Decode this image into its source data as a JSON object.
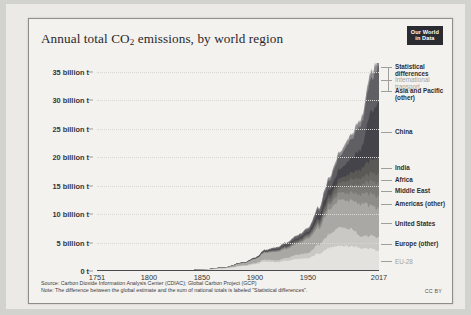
{
  "header": {
    "title_prefix": "Annual total CO",
    "title_sub": "2",
    "title_suffix": " emissions, by world region",
    "logo_line1": "Our World",
    "logo_line2": "in Data"
  },
  "footer": {
    "source": "Source: Carbon Dioxide Information Analysis Center (CDIAC); Global Carbon Project (GCP)",
    "note": "Note: The difference between the global estimate and the sum of national totals is labeled \"Statistical differences\".",
    "license": "CC BY"
  },
  "chart_data": {
    "type": "area",
    "title": "Annual total CO2 emissions, by world region",
    "xlabel": "",
    "ylabel": "",
    "xlim": [
      1751,
      2017
    ],
    "ylim": [
      0,
      36500000000
    ],
    "grid": true,
    "legend_position": "right",
    "stacked": true,
    "x_ticks": [
      "1751",
      "1800",
      "1850",
      "1900",
      "1950",
      "2017"
    ],
    "x_tick_values": [
      1751,
      1800,
      1850,
      1900,
      1950,
      2017
    ],
    "y_ticks": [
      "0 t",
      "5 billion t",
      "10 billion t",
      "15 billion t",
      "20 billion t",
      "25 billion t",
      "30 billion t",
      "35 billion t"
    ],
    "y_tick_values": [
      0,
      5,
      10,
      15,
      20,
      25,
      30,
      35
    ],
    "y_unit": "billion tonnes",
    "x": [
      1751,
      1800,
      1830,
      1850,
      1870,
      1890,
      1900,
      1910,
      1920,
      1930,
      1940,
      1950,
      1960,
      1970,
      1980,
      1990,
      2000,
      2010,
      2017
    ],
    "series": [
      {
        "name": "EU-28",
        "color": "#e3e2de",
        "values": [
          0.0,
          0.03,
          0.1,
          0.19,
          0.42,
          0.89,
          1.2,
          1.7,
          1.55,
          1.8,
          2.1,
          2.2,
          3.1,
          4.0,
          4.4,
          4.3,
          4.1,
          3.9,
          3.5
        ]
      },
      {
        "name": "Europe (other)",
        "color": "#c9c8c4",
        "values": [
          0.0,
          0.0,
          0.01,
          0.02,
          0.05,
          0.12,
          0.2,
          0.35,
          0.3,
          0.5,
          0.75,
          0.9,
          1.6,
          2.4,
          3.2,
          3.1,
          2.1,
          2.3,
          2.4
        ]
      },
      {
        "name": "United States",
        "color": "#a9a8a4",
        "values": [
          0.0,
          0.0,
          0.01,
          0.02,
          0.1,
          0.4,
          0.66,
          1.2,
          1.5,
          1.6,
          1.9,
          2.5,
          2.9,
          4.3,
          4.7,
          5.0,
          5.8,
          5.4,
          5.1
        ]
      },
      {
        "name": "Americas (other)",
        "color": "#8e8d89",
        "values": [
          0.0,
          0.0,
          0.0,
          0.0,
          0.01,
          0.03,
          0.05,
          0.1,
          0.15,
          0.2,
          0.25,
          0.35,
          0.55,
          0.85,
          1.2,
          1.35,
          1.7,
          2.0,
          2.1
        ]
      },
      {
        "name": "Middle East",
        "color": "#7a7975",
        "values": [
          0.0,
          0.0,
          0.0,
          0.0,
          0.0,
          0.01,
          0.01,
          0.03,
          0.05,
          0.08,
          0.1,
          0.15,
          0.25,
          0.45,
          0.85,
          1.2,
          1.6,
          2.2,
          2.5
        ]
      },
      {
        "name": "Africa",
        "color": "#6a6966",
        "values": [
          0.0,
          0.0,
          0.0,
          0.0,
          0.01,
          0.02,
          0.04,
          0.08,
          0.1,
          0.15,
          0.2,
          0.25,
          0.4,
          0.65,
          0.9,
          1.1,
          1.2,
          1.4,
          1.5
        ]
      },
      {
        "name": "India",
        "color": "#5a5956",
        "values": [
          0.0,
          0.0,
          0.0,
          0.0,
          0.01,
          0.03,
          0.05,
          0.08,
          0.12,
          0.15,
          0.2,
          0.22,
          0.35,
          0.5,
          0.75,
          1.1,
          1.6,
          2.4,
          2.7
        ]
      },
      {
        "name": "China",
        "color": "#45444a",
        "values": [
          0.0,
          0.0,
          0.0,
          0.0,
          0.01,
          0.02,
          0.03,
          0.05,
          0.08,
          0.12,
          0.18,
          0.22,
          0.8,
          1.0,
          1.6,
          2.5,
          3.5,
          8.5,
          9.9
        ]
      },
      {
        "name": "Asia and Pacific (other)",
        "color": "#605f63",
        "values": [
          0.0,
          0.0,
          0.0,
          0.0,
          0.01,
          0.03,
          0.06,
          0.12,
          0.2,
          0.3,
          0.45,
          0.5,
          0.9,
          1.6,
          2.3,
          3.2,
          4.2,
          5.6,
          6.3
        ]
      },
      {
        "name": "International transport",
        "color": "#8a898d",
        "values": [
          0.0,
          0.0,
          0.0,
          0.0,
          0.01,
          0.02,
          0.03,
          0.06,
          0.09,
          0.12,
          0.15,
          0.18,
          0.28,
          0.45,
          0.6,
          0.7,
          0.85,
          1.05,
          1.15
        ]
      },
      {
        "name": "Statistical differences",
        "color": "#b8b7b3",
        "values": [
          0.0,
          0.0,
          0.0,
          0.0,
          0.0,
          0.01,
          0.01,
          0.02,
          0.03,
          0.04,
          0.05,
          0.06,
          0.1,
          0.15,
          0.2,
          0.25,
          0.3,
          0.4,
          0.45
        ]
      }
    ],
    "legend_entries": [
      {
        "label": "Statistical differences",
        "dim": false
      },
      {
        "label": "International transport",
        "dim": true
      },
      {
        "label": "Asia and Pacific (other)",
        "dim": false
      },
      {
        "label": "China",
        "dim": false
      },
      {
        "label": "India",
        "dim": false
      },
      {
        "label": "Africa",
        "dim": false
      },
      {
        "label": "Middle East",
        "dim": false
      },
      {
        "label": "Americas (other)",
        "dim": false
      },
      {
        "label": "United States",
        "dim": false
      },
      {
        "label": "Europe (other)",
        "dim": false
      },
      {
        "label": "EU-28",
        "dim": true
      }
    ]
  }
}
